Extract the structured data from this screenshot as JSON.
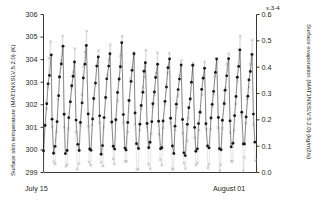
{
  "chart_data": {
    "type": "line",
    "title": "",
    "subtitle": "",
    "xlabel": "",
    "ylabel": "Surface skin temperature (MAT1NXSLV.5.2.0) (K)",
    "y2label": "Surface evaporation (MAT1NXSLV.5.2.0) (kg/m2/s)",
    "y2_multiplier": "x.3-4",
    "grid": false,
    "legend": "none",
    "x_tick_labels": [
      "July 15",
      "August 01"
    ],
    "x_range_start": "July 15",
    "x_range_end": "August 01",
    "ylim": [
      299,
      306
    ],
    "y_ticks": [
      299,
      300,
      301,
      302,
      303,
      304,
      305,
      306
    ],
    "y2lim": [
      0.0,
      0.6
    ],
    "y2_ticks": [
      0.0,
      0.1,
      0.2,
      0.3,
      0.4,
      0.5,
      0.6
    ],
    "n_days": 18,
    "samples_per_day": 8,
    "series": [
      {
        "name": "Surface skin temperature",
        "axis": "left",
        "marker": "filled-circle",
        "color": "#1a1a1a",
        "daily_min": [
          299.9,
          300.0,
          300.1,
          300.0,
          300.0,
          300.0,
          300.1,
          300.1,
          300.0,
          300.2,
          300.1,
          300.0,
          299.9,
          300.0,
          300.1,
          300.0,
          300.2,
          300.3
        ],
        "daily_max": [
          304.2,
          304.5,
          304.1,
          304.6,
          304.3,
          304.4,
          304.6,
          304.3,
          304.0,
          303.9,
          304.2,
          303.8,
          303.6,
          303.7,
          303.9,
          304.1,
          304.5,
          304.2
        ]
      },
      {
        "name": "Surface evaporation",
        "axis": "right",
        "marker": "cross",
        "color": "#b0b0b0",
        "daily_min": [
          0.02,
          0.02,
          0.03,
          0.02,
          0.02,
          0.03,
          0.02,
          0.03,
          0.02,
          0.03,
          0.03,
          0.02,
          0.02,
          0.03,
          0.02,
          0.03,
          0.03,
          0.04
        ],
        "daily_max": [
          0.5,
          0.52,
          0.47,
          0.55,
          0.49,
          0.5,
          0.54,
          0.48,
          0.45,
          0.44,
          0.47,
          0.43,
          0.41,
          0.42,
          0.45,
          0.47,
          0.53,
          0.49
        ]
      }
    ]
  },
  "axes": {
    "left_title": "Surface skin temperature (MAT1NXSLV.5.2.0) (K)",
    "right_title": "Surface evaporation (MAT1NXSLV.5.2.0) (kg/m2/s)",
    "left_ticks": [
      "306",
      "305",
      "304",
      "303",
      "302",
      "301",
      "300",
      "299"
    ],
    "right_ticks": [
      "0.6",
      "0.5",
      "0.4",
      "0.3",
      "0.2",
      "0.1",
      "0.0"
    ],
    "multiplier_label": "x.3-4",
    "x_start_label": "July 15",
    "x_end_label": "August 01"
  },
  "colors": {
    "axis": "#231f20",
    "series_temperature": "#1a1a1a",
    "series_evaporation": "#b0b0b0",
    "background": "#ffffff"
  }
}
